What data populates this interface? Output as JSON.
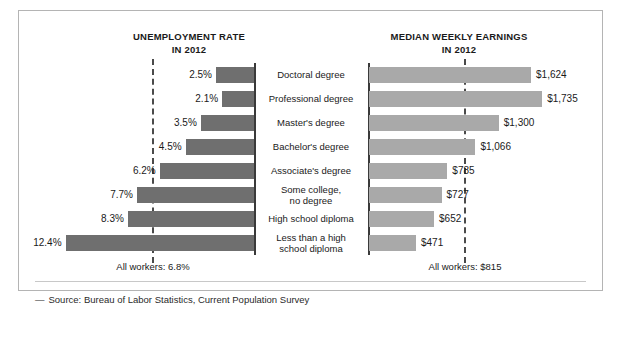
{
  "figure": {
    "left_header": {
      "line1": "UNEMPLOYMENT RATE",
      "line2": "IN 2012"
    },
    "right_header": {
      "line1": "MEDIAN WEEKLY EARNINGS",
      "line2": "IN 2012"
    },
    "footer_left": "All workers: 6.8%",
    "footer_right": "All workers: $815",
    "source_dash": "—",
    "source": "Source: Bureau of Labor Statistics, Current Population Survey"
  },
  "colors": {
    "unemployment_bar": "#6f6f6f",
    "earnings_bar": "#a9a9a9",
    "axis": "#3a3a3a",
    "reference_line": "#4a4a4a",
    "frame": "#b4b4b4"
  },
  "chart_data": {
    "type": "bar",
    "orientation": "horizontal-diverging",
    "categories": [
      "Doctoral degree",
      "Professional degree",
      "Master's degree",
      "Bachelor's degree",
      "Associate's degree",
      "Some college,\nno degree",
      "High school diploma",
      "Less than a high\nschool diploma"
    ],
    "category_lines": [
      [
        "Doctoral degree"
      ],
      [
        "Professional degree"
      ],
      [
        "Master's degree"
      ],
      [
        "Bachelor's degree"
      ],
      [
        "Associate's degree"
      ],
      [
        "Some college,",
        "no degree"
      ],
      [
        "High school diploma"
      ],
      [
        "Less than a high",
        "school diploma"
      ]
    ],
    "series": [
      {
        "name": "UNEMPLOYMENT RATE IN 2012",
        "units": "percent",
        "direction": "left",
        "values": [
          2.5,
          2.1,
          3.5,
          4.5,
          6.2,
          7.7,
          8.3,
          12.4
        ],
        "labels": [
          "2.5%",
          "2.1%",
          "3.5%",
          "4.5%",
          "6.2%",
          "7.7%",
          "8.3%",
          "12.4%"
        ],
        "reference_line": {
          "value": 6.8,
          "label": "All workers: 6.8%"
        },
        "axis_range": [
          0,
          12.4
        ]
      },
      {
        "name": "MEDIAN WEEKLY EARNINGS IN 2012",
        "units": "US dollars",
        "direction": "right",
        "values": [
          1624,
          1735,
          1300,
          1066,
          785,
          727,
          652,
          471
        ],
        "labels": [
          "$1,624",
          "$1,735",
          "$1,300",
          "$1,066",
          "$785",
          "$727",
          "$652",
          "$471"
        ],
        "reference_line": {
          "value": 815,
          "label": "All workers: $815"
        },
        "axis_range": [
          0,
          1735
        ]
      }
    ],
    "grid": false,
    "legend": "none",
    "xlabel": "",
    "ylabel": ""
  }
}
